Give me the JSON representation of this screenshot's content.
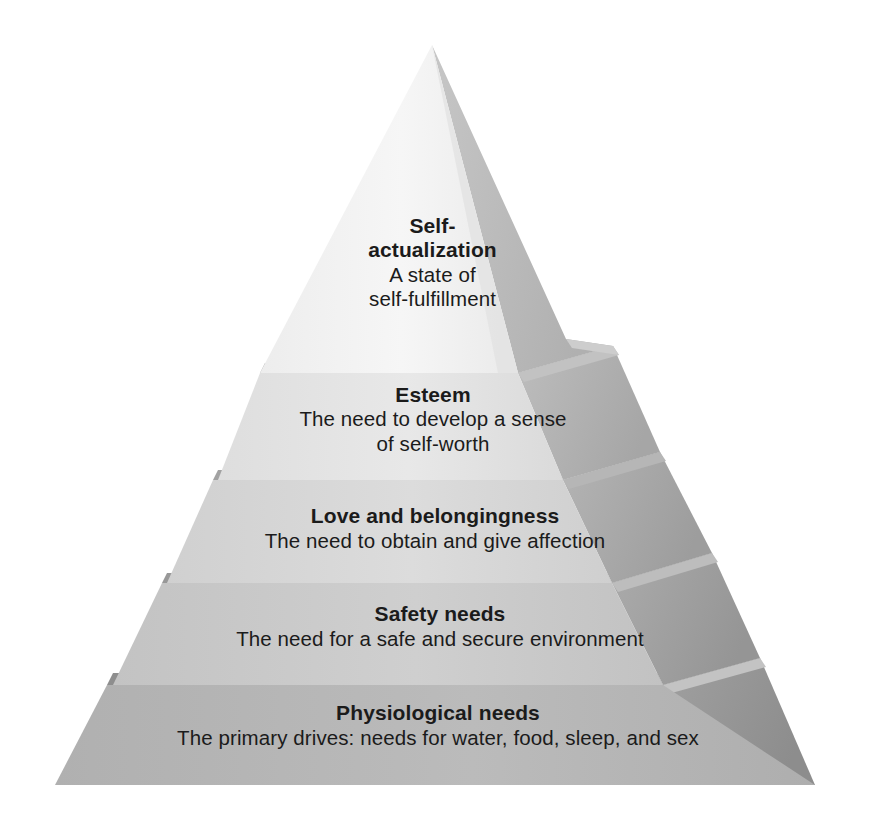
{
  "diagram": {
    "type": "pyramid",
    "name": "Maslow's hierarchy of needs",
    "tier_count": 5,
    "background_color": "#ffffff",
    "text_color": "#1b1b1b",
    "tiers": [
      {
        "id": "self-actualization",
        "level": 5,
        "position": "top",
        "title_line1": "Self-",
        "title_line2": "actualization",
        "desc_line1": "A state of",
        "desc_line2": "self-fulfillment",
        "face_color": "#f3f3f3",
        "side_color": "#bcbcbc",
        "divider_color": "#a9a9a9"
      },
      {
        "id": "esteem",
        "level": 4,
        "position": "second",
        "title_line1": "Esteem",
        "title_line2": "",
        "desc_line1": "The need to develop a sense",
        "desc_line2": "of self-worth",
        "face_color": "#e4e4e4",
        "side_color": "#b2b2b2",
        "divider_color": "#a2a2a2"
      },
      {
        "id": "love-and-belongingness",
        "level": 3,
        "position": "middle",
        "title_line1": "Love and belongingness",
        "title_line2": "",
        "desc_line1": "The need to obtain and give affection",
        "desc_line2": "",
        "face_color": "#d6d6d6",
        "side_color": "#a8a8a8",
        "divider_color": "#989898"
      },
      {
        "id": "safety-needs",
        "level": 2,
        "position": "fourth",
        "title_line1": "Safety needs",
        "title_line2": "",
        "desc_line1": "The need for a safe and secure environment",
        "desc_line2": "",
        "face_color": "#c8c8c8",
        "side_color": "#9e9e9e",
        "divider_color": "#8e8e8e"
      },
      {
        "id": "physiological-needs",
        "level": 1,
        "position": "base",
        "title_line1": "Physiological needs",
        "title_line2": "",
        "desc_line1": "The primary drives: needs for water, food, sleep, and sex",
        "desc_line2": "",
        "face_color": "#b4b4b4",
        "side_color": "#949494",
        "divider_color": "#888888"
      }
    ]
  }
}
